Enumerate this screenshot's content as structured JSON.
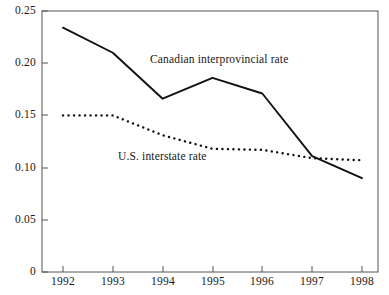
{
  "chart_data": {
    "type": "line",
    "title": "",
    "subtitle": "",
    "xlabel": "",
    "ylabel": "",
    "x": [
      1992,
      1993,
      1994,
      1995,
      1996,
      1997,
      1998
    ],
    "xtick_labels": [
      "1992",
      "1993",
      "1994",
      "1995",
      "1996",
      "1997",
      "1998"
    ],
    "ytick_labels": [
      "0",
      "0.05",
      "0.10",
      "0.15",
      "0.20",
      "0.25"
    ],
    "ytick_values": [
      0,
      0.05,
      0.1,
      0.15,
      0.2,
      0.25
    ],
    "ylim": [
      0,
      0.25
    ],
    "xlim": [
      1992,
      1998
    ],
    "grid": false,
    "legend_position": "inline-annotations",
    "series": [
      {
        "name": "Canadian interprovincial rate",
        "style": "solid",
        "color": "#111111",
        "values": [
          0.234,
          0.21,
          0.166,
          0.186,
          0.171,
          0.111,
          0.09
        ]
      },
      {
        "name": "U.S. interstate rate",
        "style": "dotted",
        "color": "#111111",
        "values": [
          0.15,
          0.15,
          0.131,
          0.118,
          0.117,
          0.109,
          0.107
        ]
      }
    ],
    "annotations": [
      {
        "text": "Canadian interprovincial rate",
        "x": 1994.15,
        "y": 0.203
      },
      {
        "text": "U.S. interstate rate",
        "x": 1993.45,
        "y": 0.1025
      }
    ]
  },
  "axes": {
    "frame_color": "#555555",
    "tick_color": "#555555",
    "line_color": "#111111"
  }
}
